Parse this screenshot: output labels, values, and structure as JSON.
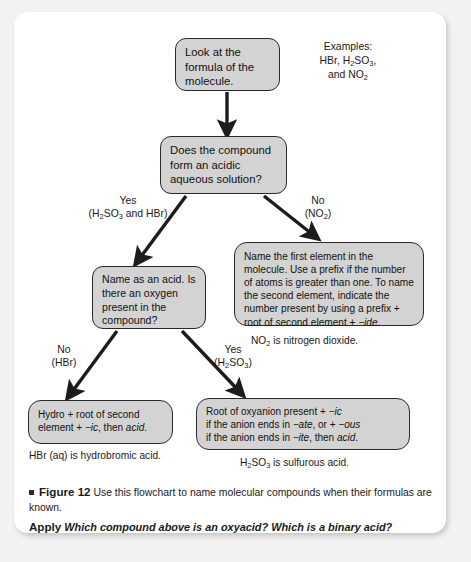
{
  "figure": {
    "bullet": "■",
    "label": "Figure 12",
    "caption": "Use this flowchart to name molecular compounds when their formulas are known.",
    "apply_word": "Apply",
    "apply_question": "Which compound above is an oxyacid? Which is a binary acid?"
  },
  "flowchart": {
    "nodes": {
      "start": "Look at the formula of the molecule.",
      "question1": "Does the compound form an acidic aqueous solution?",
      "acid": "Name as an acid. Is there an oxygen present in the compound?",
      "molecular_line1": "Name the first element in the",
      "molecular_line2": "molecule. Use a prefix if the number",
      "molecular_line3": "of atoms is greater than one. To",
      "molecular_line4": "name the second element, indicate the",
      "molecular_line5": "number present by using a prefix +",
      "molecular_line6a": "root of second element + ",
      "molecular_line6b": "−ide",
      "molecular_line6c": ".",
      "binary_a": "Hydro + root of second",
      "binary_b": "element + ",
      "binary_c": "−ic",
      "binary_d": ", then ",
      "binary_e": "acid",
      "binary_f": ".",
      "oxyacid_1a": "Root of oxyanion present + ",
      "oxyacid_1b": "−ic",
      "oxyacid_2a": "if the anion ends in ",
      "oxyacid_2b": "−ate",
      "oxyacid_2c": ", or + ",
      "oxyacid_2d": "−ous",
      "oxyacid_3a": "if the anion ends in ",
      "oxyacid_3b": "−ite",
      "oxyacid_3c": ", then ",
      "oxyacid_3d": "acid",
      "oxyacid_3e": "."
    },
    "branch_labels": {
      "yes1_word": "Yes",
      "yes1_detail_a": "(H",
      "yes1_detail_b": "2",
      "yes1_detail_c": "SO",
      "yes1_detail_d": "3",
      "yes1_detail_e": " and HBr)",
      "no1_word": "No",
      "no1_detail_a": "(NO",
      "no1_detail_b": "2",
      "no1_detail_c": ")",
      "no2_word": "No",
      "no2_detail": "(HBr)",
      "yes2_word": "Yes",
      "yes2_detail_a": "(H",
      "yes2_detail_b": "2",
      "yes2_detail_c": "SO",
      "yes2_detail_d": "3",
      "yes2_detail_e": ")"
    },
    "notes": {
      "examples_title": "Examples:",
      "examples_line2a": "HBr, H",
      "examples_line2b": "2",
      "examples_line2c": "SO",
      "examples_line2d": "3",
      "examples_line2e": ",",
      "examples_line3a": "and NO",
      "examples_line3b": "2",
      "no2_note_a": "NO",
      "no2_note_b": "2",
      "no2_note_c": " is nitrogen dioxide.",
      "hbr_note": "HBr (aq) is hydrobromic acid.",
      "h2so3_note_a": "H",
      "h2so3_note_b": "2",
      "h2so3_note_c": "SO",
      "h2so3_note_d": "3",
      "h2so3_note_e": " is sulfurous acid."
    }
  },
  "colors": {
    "node_fill": "#d3d3d3",
    "node_border": "#2a2a2a",
    "arrow": "#1c1c1c",
    "card": "#ffffff",
    "page": "#f2f2f2"
  }
}
